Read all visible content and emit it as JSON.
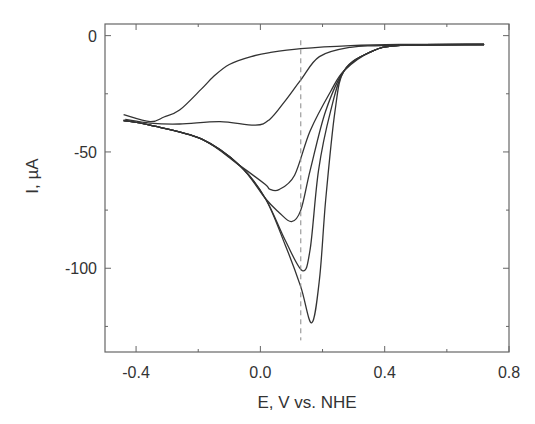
{
  "chart_data": {
    "type": "line",
    "title": "",
    "xlabel": "E, V vs. NHE",
    "ylabel": "I, µA",
    "xlim": [
      -0.5,
      0.8
    ],
    "ylim": [
      -136,
      5
    ],
    "xticks": [
      -0.4,
      0.0,
      0.4,
      0.8
    ],
    "xtick_labels": [
      "-0.4",
      "0.0",
      "0.4",
      "0.8"
    ],
    "xminor_ticks": [
      -0.2,
      0.2,
      0.6
    ],
    "yticks": [
      0,
      -50,
      -100
    ],
    "ytick_labels": [
      "0",
      "-50",
      "-100"
    ],
    "yminor_ticks": [
      -25,
      -75,
      -125
    ],
    "grid": false,
    "legend": null,
    "annotations": [
      {
        "type": "vertical-dashed-line",
        "x": 0.13,
        "y_range": [
          -2,
          -131
        ]
      }
    ],
    "series": [
      {
        "name": "scan-1",
        "x": [
          0.72,
          0.45,
          0.29,
          0.13,
          0.03,
          -0.03,
          -0.1,
          -0.15,
          -0.19,
          -0.26,
          -0.31,
          -0.355,
          -0.44
        ],
        "y": [
          -3.8,
          -3.8,
          -4.3,
          -5.6,
          -7.3,
          -9,
          -12.4,
          -17.5,
          -23,
          -32,
          -35,
          -37,
          -34
        ]
      },
      {
        "name": "scan-2",
        "x": [
          -0.435,
          -0.355,
          -0.26,
          -0.13,
          -0.016,
          0.03,
          0.08,
          0.13,
          0.19,
          0.29,
          0.39,
          0.72
        ],
        "y": [
          -36,
          -37.6,
          -38,
          -37,
          -38.5,
          -36,
          -28,
          -19,
          -9,
          -5,
          -4.3,
          -3.8
        ]
      },
      {
        "name": "scan-3",
        "x": [
          -0.44,
          -0.355,
          -0.19,
          -0.065,
          0.016,
          0.03,
          0.06,
          0.11,
          0.16,
          0.226,
          0.27,
          0.355,
          0.45,
          0.72
        ],
        "y": [
          -36.5,
          -38.5,
          -44.4,
          -56,
          -64,
          -66,
          -66.2,
          -60,
          -41,
          -24,
          -15,
          -7,
          -4.2,
          -3.8
        ]
      },
      {
        "name": "scan-4",
        "x": [
          -0.44,
          -0.355,
          -0.19,
          -0.065,
          0.016,
          0.06,
          0.1,
          0.13,
          0.16,
          0.21,
          0.27,
          0.355,
          0.45,
          0.72
        ],
        "y": [
          -36.5,
          -38.5,
          -44.4,
          -56,
          -70,
          -76,
          -80,
          -75,
          -58,
          -32.5,
          -15,
          -7,
          -4.2,
          -3.8
        ]
      },
      {
        "name": "scan-5",
        "x": [
          -0.44,
          -0.355,
          -0.19,
          -0.065,
          0.016,
          0.08,
          0.135,
          0.16,
          0.187,
          0.226,
          0.27,
          0.355,
          0.45,
          0.72
        ],
        "y": [
          -36.5,
          -38.5,
          -44.4,
          -56,
          -70,
          -88,
          -101,
          -92,
          -58,
          -32.5,
          -15,
          -7,
          -4.2,
          -3.8
        ]
      },
      {
        "name": "scan-6",
        "x": [
          -0.44,
          -0.355,
          -0.19,
          -0.065,
          0.016,
          0.08,
          0.13,
          0.165,
          0.19,
          0.21,
          0.24,
          0.27,
          0.355,
          0.45,
          0.72
        ],
        "y": [
          -36.5,
          -38.5,
          -44.4,
          -56,
          -70,
          -90,
          -108,
          -123.5,
          -105,
          -71,
          -32.5,
          -15,
          -7,
          -4.2,
          -3.8
        ]
      }
    ]
  },
  "colors": {
    "line": "#333333",
    "axis": "#666666",
    "dashed": "#888888",
    "text": "#333333"
  }
}
